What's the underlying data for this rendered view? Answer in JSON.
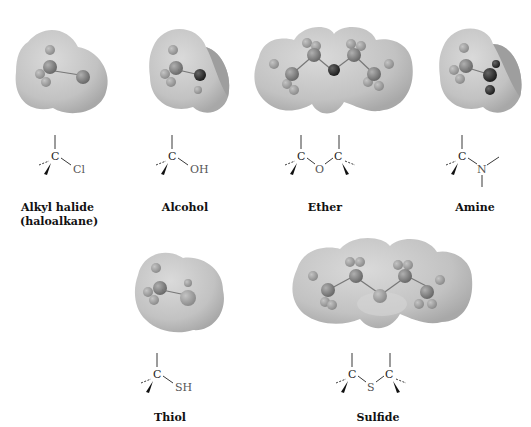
{
  "figure": {
    "caption_clipped": "",
    "groups": [
      {
        "id": "alkyl-halide",
        "label": "Alkyl halide",
        "sublabel": "(haloalkane)",
        "substituent": "Cl"
      },
      {
        "id": "alcohol",
        "label": "Alcohol",
        "substituent": "OH"
      },
      {
        "id": "ether",
        "label": "Ether",
        "bridge": "O",
        "atom_c": "C"
      },
      {
        "id": "amine",
        "label": "Amine",
        "substituent": "N"
      },
      {
        "id": "thiol",
        "label": "Thiol",
        "substituent": "SH"
      },
      {
        "id": "sulfide",
        "label": "Sulfide",
        "bridge": "S",
        "atom_c": "C"
      }
    ],
    "atom_c": "C",
    "colors": {
      "surface": "#c8c8c8",
      "surface_shade": "#a9a9a9",
      "atom_dark": "#3a3a3a",
      "atom_mid": "#7a7a7a",
      "atom_light": "#a0a0a0",
      "ink": "#111111"
    }
  }
}
